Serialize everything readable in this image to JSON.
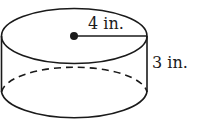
{
  "figure": {
    "shape": "cylinder",
    "radius_label": "4 in.",
    "height_label": "3 in.",
    "stroke_color": "#1a1a1a",
    "background": "#ffffff"
  }
}
